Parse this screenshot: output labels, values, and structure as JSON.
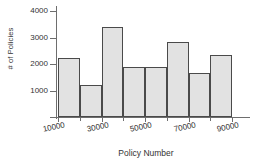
{
  "chart_data": {
    "type": "bar",
    "title": "",
    "xlabel": "Policy Number",
    "ylabel": "# of Policies",
    "categories": [
      "10000-20000",
      "20000-30000",
      "30000-40000",
      "40000-50000",
      "50000-60000",
      "60000-70000",
      "70000-80000",
      "80000-90000"
    ],
    "bin_edges": [
      10000,
      20000,
      30000,
      40000,
      50000,
      60000,
      70000,
      80000,
      90000
    ],
    "values": [
      2250,
      1220,
      3400,
      1880,
      1900,
      2830,
      1670,
      2350
    ],
    "xlim": [
      10000,
      90000
    ],
    "ylim": [
      0,
      4200
    ],
    "xticks": [
      10000,
      30000,
      50000,
      70000,
      90000
    ],
    "xtick_labels": [
      "10000",
      "30000",
      "50000",
      "70000",
      "90000"
    ],
    "yticks": [
      1000,
      2000,
      3000,
      4000
    ],
    "ytick_labels": [
      "1000",
      "2000",
      "3000",
      "4000"
    ],
    "grid": false,
    "legend": null,
    "bar_fill_color": "#e2e2e2",
    "bar_edge_color": "#4a4a4a",
    "axis_color": "#6e6e6e",
    "background_color": "#ffffff"
  },
  "axes": {
    "ylabel": "# of Policies",
    "xlabel": "Policy Number"
  }
}
